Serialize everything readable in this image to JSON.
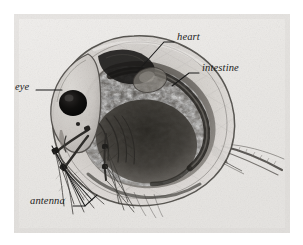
{
  "figure": {
    "plate_background_color": "#eeecea",
    "page_background_color": "#ffffff",
    "label_color": "#1c1c1c",
    "leader_line_color": "#1a1a1a",
    "organism_dark_color": "#2b2b2b"
  },
  "labels": [
    {
      "id": "eye",
      "text": "eye",
      "text_x": 15,
      "text_y": 88,
      "leader": "M 36 90 L 62 90"
    },
    {
      "id": "heart",
      "text": "heart",
      "text_x": 177,
      "text_y": 38,
      "leader": "M 174 42 L 164 42 L 137 72"
    },
    {
      "id": "intestine",
      "text": "intestine",
      "text_x": 202,
      "text_y": 69,
      "leader": "M 199 73 L 189 73 L 172 86"
    },
    {
      "id": "antenna",
      "text": "antenna",
      "text_x": 30,
      "text_y": 202,
      "leader_primary": "M 73 206 L 85 206 L 97 195",
      "leader_secondary": "M 85 206 L 52 146",
      "leader_tertiary": "M 92 200 L 62 167"
    }
  ],
  "anatomy_parts": [
    "eye",
    "heart",
    "intestine",
    "antenna",
    "carapace",
    "brood chamber",
    "tail spine",
    "thoracic legs"
  ]
}
